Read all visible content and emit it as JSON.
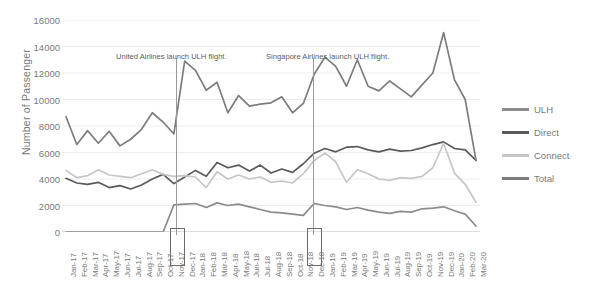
{
  "chart_data": {
    "type": "line",
    "title": "",
    "xlabel": "",
    "ylabel": "Number of Passenger",
    "ylim": [
      0,
      16000
    ],
    "yticks": [
      0,
      2000,
      4000,
      6000,
      8000,
      10000,
      12000,
      14000,
      16000
    ],
    "grid": true,
    "legend_position": "right",
    "categories": [
      "Jan-17",
      "Feb-17",
      "Mar-17",
      "Apr-17",
      "May-17",
      "Jun-17",
      "Jul-17",
      "Aug-17",
      "Sep-17",
      "Oct-17",
      "Nov-17",
      "Dec-17",
      "Jan-18",
      "Feb-18",
      "Mar-18",
      "Apr-18",
      "May-18",
      "Jun-18",
      "Jul-18",
      "Aug-18",
      "Sep-18",
      "Oct-18",
      "Nov-18",
      "Dec-18",
      "Jan-19",
      "Feb-19",
      "Mar-19",
      "Apr-19",
      "May-19",
      "Jun-19",
      "Jul-19",
      "Aug-19",
      "Sep-19",
      "Oct-19",
      "Nov-19",
      "Dec-19",
      "Jan-20",
      "Feb-20",
      "Mar-20"
    ],
    "series": [
      {
        "name": "ULH",
        "color": "#8c8c8c",
        "values": [
          0,
          0,
          0,
          0,
          0,
          0,
          0,
          0,
          0,
          0,
          2050,
          2100,
          2150,
          1850,
          2200,
          2000,
          2100,
          1900,
          1700,
          1500,
          1450,
          1350,
          1250,
          2150,
          2000,
          1900,
          1700,
          1850,
          1650,
          1500,
          1400,
          1550,
          1500,
          1750,
          1800,
          1900,
          1600,
          1350,
          450
        ]
      },
      {
        "name": "Direct",
        "color": "#5a5a5a",
        "values": [
          4050,
          3700,
          3600,
          3750,
          3350,
          3500,
          3250,
          3550,
          4000,
          4350,
          3650,
          4150,
          4650,
          4200,
          5250,
          4850,
          5050,
          4600,
          5050,
          4450,
          4750,
          4500,
          5150,
          5950,
          6300,
          6050,
          6400,
          6450,
          6200,
          6050,
          6250,
          6100,
          6150,
          6350,
          6600,
          6800,
          6300,
          6200,
          5400
        ]
      },
      {
        "name": "Connect",
        "color": "#c6c6c6",
        "values": [
          4650,
          4100,
          4250,
          4700,
          4300,
          4200,
          4100,
          4400,
          4700,
          4350,
          4200,
          4250,
          4150,
          3350,
          4550,
          4000,
          4300,
          4000,
          4150,
          3750,
          3850,
          3700,
          4400,
          5400,
          5950,
          5300,
          3750,
          4700,
          4400,
          4000,
          3900,
          4100,
          4050,
          4200,
          4850,
          6700,
          4450,
          3600,
          2250
        ]
      },
      {
        "name": "Total",
        "color": "#7d7d7d",
        "values": [
          8700,
          6600,
          7650,
          6700,
          7600,
          6500,
          7000,
          7750,
          9000,
          8300,
          7400,
          12900,
          12200,
          10700,
          11300,
          9000,
          10300,
          9500,
          9650,
          9750,
          10200,
          9000,
          9700,
          11900,
          13200,
          12500,
          11000,
          13000,
          11000,
          10650,
          11400,
          10800,
          10200,
          11100,
          12000,
          15050,
          11500,
          10000,
          5400
        ]
      }
    ],
    "annotations": [
      {
        "text": "United Airlines launch ULH flight.",
        "at": "Oct-17"
      },
      {
        "text": "Singapore Airlines launch ULH flight.",
        "at": "Nov-18"
      }
    ],
    "highlighted_categories": [
      "Oct-17",
      "Nov-18"
    ]
  }
}
